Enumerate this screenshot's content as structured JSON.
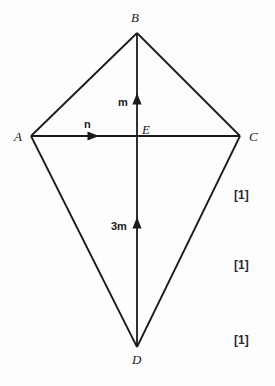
{
  "figure": {
    "type": "kite-diagram",
    "background_color": "#fdfdfd",
    "stroke_color": "#1a1a1a",
    "stroke_width": 1.8,
    "width": 275,
    "height": 386
  },
  "vertices": {
    "B": {
      "label": "B",
      "x": 137,
      "y": 33
    },
    "A": {
      "label": "A",
      "x": 31,
      "y": 136
    },
    "C": {
      "label": "C",
      "x": 240,
      "y": 136
    },
    "D": {
      "label": "D",
      "x": 137,
      "y": 347
    },
    "E": {
      "label": "E",
      "x": 137,
      "y": 136
    }
  },
  "vectors": {
    "m": {
      "label": "m",
      "direction": "up",
      "from": "E",
      "to": "B"
    },
    "n": {
      "label": "n",
      "direction": "right",
      "from": "A",
      "to": "E"
    },
    "3m": {
      "label": "3m",
      "direction": "up",
      "from": "D",
      "to": "E"
    }
  },
  "edges": [
    {
      "from": "A",
      "to": "B"
    },
    {
      "from": "B",
      "to": "C"
    },
    {
      "from": "A",
      "to": "D"
    },
    {
      "from": "C",
      "to": "D"
    },
    {
      "from": "A",
      "to": "C"
    },
    {
      "from": "B",
      "to": "D"
    }
  ],
  "marks": [
    {
      "label": "[1]"
    },
    {
      "label": "[1]"
    },
    {
      "label": "[1]"
    }
  ]
}
